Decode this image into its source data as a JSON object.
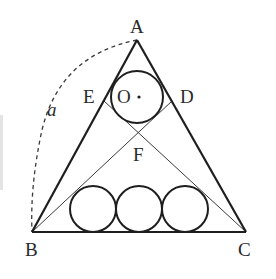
{
  "diagram": {
    "type": "geometry",
    "colors": {
      "stroke": "#1e1e1e",
      "thin_stroke": "#3a3a3a",
      "label": "#2a2a2a",
      "background": "#ffffff"
    },
    "labels": {
      "A": "A",
      "B": "B",
      "C": "C",
      "D": "D",
      "E": "E",
      "F": "F",
      "O": "O",
      "a": "a"
    },
    "points": {
      "A": [
        137,
        40
      ],
      "B": [
        32,
        232
      ],
      "C": [
        246,
        232
      ],
      "E": [
        104,
        101
      ],
      "D": [
        172,
        101
      ],
      "F": [
        139,
        134
      ]
    },
    "circles": {
      "top": {
        "name": "O",
        "center": [
          137,
          97
        ],
        "r": 26
      },
      "bottom": [
        {
          "center": [
            93,
            209
          ],
          "r": 23
        },
        {
          "center": [
            139,
            209
          ],
          "r": 23
        },
        {
          "center": [
            185,
            209
          ],
          "r": 23
        }
      ]
    },
    "arc": {
      "from": "A",
      "to": "B",
      "style": "dashed",
      "label": "a"
    }
  }
}
